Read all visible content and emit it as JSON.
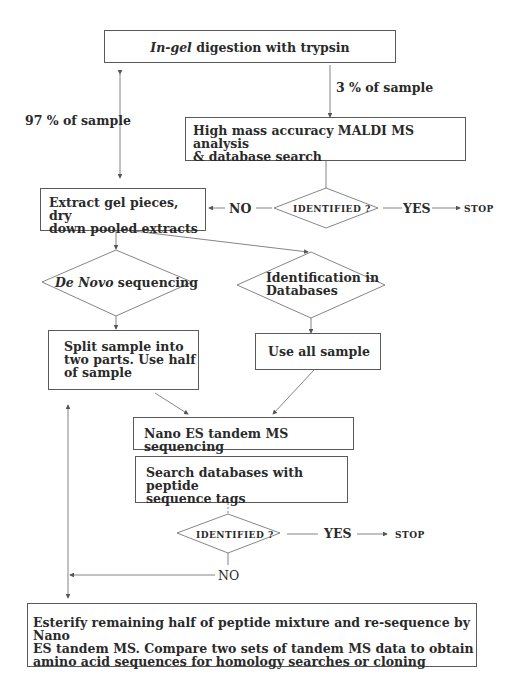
{
  "nodes": {
    "digestion": {
      "italic": "In-gel",
      "rest": " digestion with  trypsin"
    },
    "maldi": {
      "line1": "High mass accuracy MALDI MS  analysis",
      "line2": "& database search"
    },
    "decision1": {
      "label": "IDENTIFIED ?"
    },
    "extract": {
      "line1": "Extract gel pieces, dry",
      "line2": "down pooled extracts"
    },
    "denovo": {
      "italic": "De Novo",
      "rest": " sequencing"
    },
    "identification": {
      "line1": "Identification in",
      "line2": "Databases"
    },
    "split": {
      "line1": "Split sample into",
      "line2": "two parts. Use half",
      "line3": "of sample"
    },
    "useall": {
      "label": "Use all sample"
    },
    "nanoes": {
      "label": "Nano ES tandem MS sequencing"
    },
    "search": {
      "line1": "Search databases with peptide",
      "line2": "sequence tags"
    },
    "decision2": {
      "label": "IDENTIFIED ?"
    },
    "esterify": {
      "line1": "Esterify remaining half of peptide mixture and re-sequence by Nano",
      "line2": "ES tandem MS. Compare two sets of tandem MS data to obtain",
      "line3": "amino acid sequences for homology searches or cloning"
    }
  },
  "edge_labels": {
    "split97": "97 % of sample",
    "split3": "3 % of sample",
    "no1": "NO",
    "yes1": "YES",
    "stop1": "STOP",
    "yes2": "YES",
    "stop2": "STOP",
    "no2": "NO"
  }
}
